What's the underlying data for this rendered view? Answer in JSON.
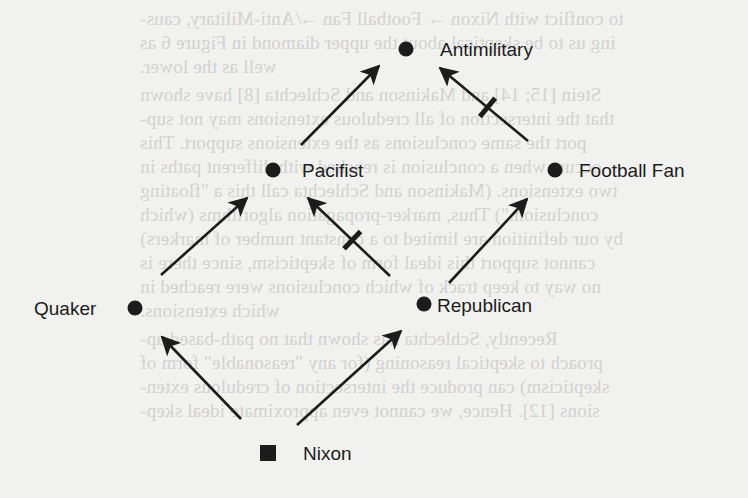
{
  "figure": {
    "type": "inheritance-network",
    "nodes": [
      {
        "id": "antimilitary",
        "label": "Antimilitary",
        "shape": "circle",
        "cx": 406,
        "cy": 49,
        "label_x": 440,
        "label_y": 56
      },
      {
        "id": "pacifist",
        "label": "Pacifist",
        "shape": "circle",
        "cx": 273,
        "cy": 170,
        "label_x": 302,
        "label_y": 177
      },
      {
        "id": "football_fan",
        "label": "Football Fan",
        "shape": "circle",
        "cx": 555,
        "cy": 170,
        "label_x": 579,
        "label_y": 177
      },
      {
        "id": "quaker",
        "label": "Quaker",
        "shape": "circle",
        "cx": 135,
        "cy": 308,
        "label_x": 34,
        "label_y": 315
      },
      {
        "id": "republican",
        "label": "Republican",
        "shape": "circle",
        "cx": 424,
        "cy": 304,
        "label_x": 437,
        "label_y": 312
      },
      {
        "id": "nixon",
        "label": "Nixon",
        "shape": "square",
        "cx": 268,
        "cy": 453,
        "label_x": 303,
        "label_y": 460
      }
    ],
    "edges": [
      {
        "from": "nixon",
        "to": "quaker",
        "type": "positive",
        "x1": 241,
        "y1": 419,
        "x2": 162,
        "y2": 337
      },
      {
        "from": "nixon",
        "to": "republican",
        "type": "positive",
        "x1": 297,
        "y1": 425,
        "x2": 401,
        "y2": 331
      },
      {
        "from": "quaker",
        "to": "pacifist",
        "type": "positive",
        "x1": 161,
        "y1": 275,
        "x2": 247,
        "y2": 198
      },
      {
        "from": "republican",
        "to": "pacifist",
        "type": "negative",
        "x1": 390,
        "y1": 276,
        "x2": 308,
        "y2": 198
      },
      {
        "from": "republican",
        "to": "football_fan",
        "type": "positive",
        "x1": 449,
        "y1": 283,
        "x2": 527,
        "y2": 199
      },
      {
        "from": "pacifist",
        "to": "antimilitary",
        "type": "positive",
        "x1": 301,
        "y1": 145,
        "x2": 379,
        "y2": 66
      },
      {
        "from": "football_fan",
        "to": "antimilitary",
        "type": "negative",
        "x1": 528,
        "y1": 141,
        "x2": 440,
        "y2": 68
      }
    ],
    "colors": {
      "ink": "#1c1c1c",
      "paper": "#f1f1ef",
      "bleed_through": "#d2d2cf"
    }
  },
  "bleed_through_text": [
    {
      "text": "to conflict with Nixon → Football Fan ↛ Anti-Military, caus-",
      "x": 140,
      "y": 8
    },
    {
      "text": "ing us to be skeptical about the upper diamond in Figure 6 as",
      "x": 140,
      "y": 32
    },
    {
      "text": "well as the lower.",
      "x": 140,
      "y": 56
    },
    {
      "text": "Stein [15; 14] and Makinson and Schlechta [8] have shown",
      "x": 140,
      "y": 84
    },
    {
      "text": "that the intersection of all credulous extensions may not sup-",
      "x": 140,
      "y": 108
    },
    {
      "text": "port the same conclusions as the extensions support. This",
      "x": 140,
      "y": 132
    },
    {
      "text": "occurs when a conclusion is reached with different paths in",
      "x": 140,
      "y": 156
    },
    {
      "text": "two extensions. (Makinson and Schlechta call this a \"floating",
      "x": 140,
      "y": 180
    },
    {
      "text": "conclusion.\") Thus, marker-propagation algorithms (which",
      "x": 140,
      "y": 204
    },
    {
      "text": "by our definition are limited to a constant number of markers)",
      "x": 140,
      "y": 228
    },
    {
      "text": "cannot support this ideal form of skepticism, since there is",
      "x": 140,
      "y": 252
    },
    {
      "text": "no way to keep track of which conclusions were reached in",
      "x": 140,
      "y": 276
    },
    {
      "text": "which extensions.",
      "x": 140,
      "y": 300
    },
    {
      "text": "Recently, Schlechta has shown that no path-based ap-",
      "x": 140,
      "y": 328
    },
    {
      "text": "proach to skeptical reasoning (for any \"reasonable\" form of",
      "x": 140,
      "y": 352
    },
    {
      "text": "skepticism) can produce the intersection of credulous exten-",
      "x": 140,
      "y": 376
    },
    {
      "text": "sions [12]. Hence, we cannot even approximate ideal skep-",
      "x": 140,
      "y": 400
    }
  ]
}
